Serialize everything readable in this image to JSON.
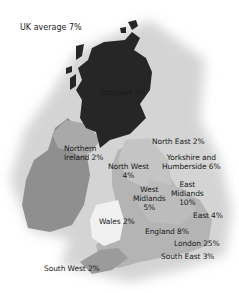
{
  "title": "UK average 7%",
  "colors": {
    "halo": "#d6d6d6",
    "scotland": "#262626",
    "ireland": "#8f8f8f",
    "northern_ireland": "#a8a8a8",
    "england_mid": "#b3b3b3",
    "england_light": "#c8c8c8",
    "wales": "#f0f0f0",
    "south_west": "#9a9a9a"
  },
  "regions": [
    {
      "name": "Scotland",
      "value": "2%",
      "label": "Scotland 2%"
    },
    {
      "name": "Northern Ireland",
      "value": "2%",
      "label_line1": "Northern",
      "label_line2": "Ireland 2%"
    },
    {
      "name": "North East",
      "value": "2%",
      "label": "North East 2%"
    },
    {
      "name": "North West",
      "value": "4%",
      "label_line1": "North West",
      "label_line2": "4%"
    },
    {
      "name": "Yorkshire and Humberside",
      "value": "6%",
      "label_line1": "Yorkshire and",
      "label_line2": "Humberside 6%"
    },
    {
      "name": "West Midlands",
      "value": "5%",
      "label_line1": "West",
      "label_line2": "Midlands",
      "label_line3": "5%"
    },
    {
      "name": "East Midlands",
      "value": "10%",
      "label_line1": "East",
      "label_line2": "Midlands",
      "label_line3": "10%"
    },
    {
      "name": "East",
      "value": "4%",
      "label": "East 4%"
    },
    {
      "name": "Wales",
      "value": "2%",
      "label": "Wales 2%"
    },
    {
      "name": "England",
      "value": "8%",
      "label": "England 8%"
    },
    {
      "name": "London",
      "value": "25%",
      "label": "London 25%"
    },
    {
      "name": "South East",
      "value": "3%",
      "label": "South East 3%"
    },
    {
      "name": "South West",
      "value": "2%",
      "label": "South West 2%"
    }
  ]
}
